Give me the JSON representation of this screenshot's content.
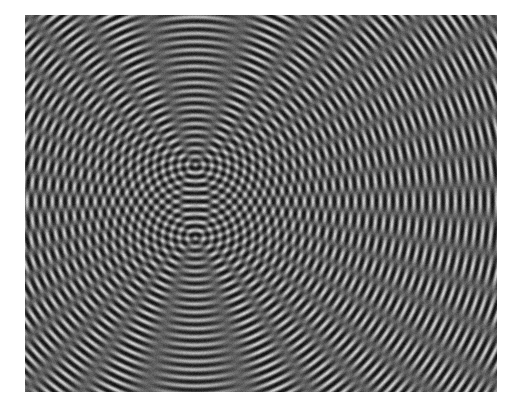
{
  "image": {
    "subject": "two-source wave interference pattern",
    "description": "Black and white photograph of interference fringes from two point sources arranged vertically",
    "colors": {
      "background": "#ffffff",
      "dark": "#141414",
      "light": "#c8c8c8"
    },
    "wavelength_ratio": 1.0,
    "source_count": 2
  }
}
